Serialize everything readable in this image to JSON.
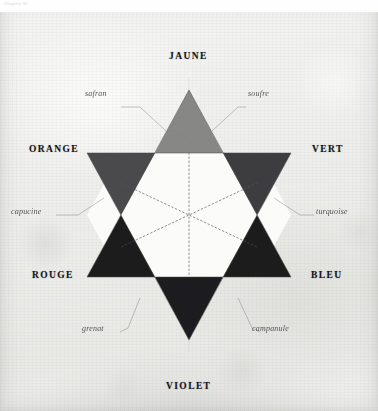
{
  "page": {
    "header_text": "Chapitre VI",
    "plate_title": "Étoile des couleurs"
  },
  "diagram": {
    "type": "color-star-hexagram",
    "background_color": "#eeeeec",
    "inner_hexagon_color": "#fbfbf9",
    "primaries": [
      {
        "id": "jaune",
        "label": "JAUNE",
        "position": "top",
        "triangle": "up",
        "tone_hex": "#8a8a88",
        "label_x": 169,
        "label_y": 51
      },
      {
        "id": "rouge",
        "label": "ROUGE",
        "position": "bottom-left",
        "triangle": "up",
        "tone_hex": "#1b1b1d",
        "label_x": 32,
        "label_y": 270
      },
      {
        "id": "bleu",
        "label": "BLEU",
        "position": "bottom-right",
        "triangle": "up",
        "tone_hex": "#1b1b1d",
        "label_x": 311,
        "label_y": 270
      }
    ],
    "secondaries": [
      {
        "id": "orange",
        "label": "ORANGE",
        "position": "top-left",
        "triangle": "down",
        "tone_hex": "#4c4c4e",
        "label_x": 29,
        "label_y": 144
      },
      {
        "id": "vert",
        "label": "VERT",
        "position": "top-right",
        "triangle": "down",
        "tone_hex": "#3f3f42",
        "label_x": 312,
        "label_y": 144
      },
      {
        "id": "violet",
        "label": "VIOLET",
        "position": "bottom",
        "triangle": "down",
        "tone_hex": "#1e1e20",
        "label_x": 166,
        "label_y": 381
      }
    ],
    "intermediates": [
      {
        "id": "safran",
        "label": "safran",
        "position": "upper-left",
        "label_x": 85,
        "label_y": 89
      },
      {
        "id": "soufre",
        "label": "soufre",
        "position": "upper-right",
        "label_x": 248,
        "label_y": 89
      },
      {
        "id": "capucine",
        "label": "capucine",
        "position": "mid-left",
        "label_x": 11,
        "label_y": 207
      },
      {
        "id": "turquoise",
        "label": "turquoise",
        "position": "mid-right",
        "label_x": 316,
        "label_y": 207
      },
      {
        "id": "grenat",
        "label": "grenat",
        "position": "lower-left",
        "label_x": 82,
        "label_y": 324
      },
      {
        "id": "campanule",
        "label": "campanule",
        "position": "lower-right",
        "label_x": 252,
        "label_y": 324
      }
    ]
  }
}
